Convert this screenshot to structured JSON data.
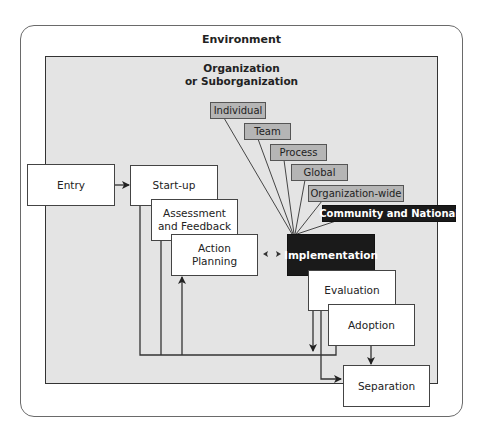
{
  "environment": {
    "label": "Environment"
  },
  "organization": {
    "label_line1": "Organization",
    "label_line2": "or Suborganization"
  },
  "phases": {
    "entry": "Entry",
    "startup": "Start-up",
    "assessment_line1": "Assessment",
    "assessment_line2": "and Feedback",
    "action_line1": "Action",
    "action_line2": "Planning",
    "implementation": "Implementation",
    "evaluation": "Evaluation",
    "adoption": "Adoption",
    "separation": "Separation"
  },
  "levels": [
    {
      "label": "Individual"
    },
    {
      "label": "Team"
    },
    {
      "label": "Process"
    },
    {
      "label": "Global"
    },
    {
      "label": "Organization-wide"
    },
    {
      "label": "Community and National"
    }
  ],
  "colors": {
    "org_background": "#e4e4e4",
    "level_tag": "#b5b5b5",
    "highlight": "#1a1a1a"
  }
}
